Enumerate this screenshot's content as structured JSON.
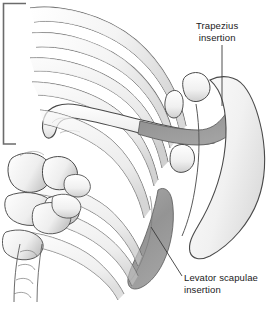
{
  "figure": {
    "kind": "anatomical-line-drawing",
    "background_color": "#ffffff",
    "line_color": "#4a4a4a",
    "shading_color": "#9a9a9a",
    "light_shading_color": "#d9d9d9"
  },
  "frame": {
    "name": "border-bracket",
    "color": "#6b6b6b"
  },
  "labels": {
    "trapezius": {
      "line1": "Trapezius",
      "line2": "insertion",
      "leader": "vertical"
    },
    "levator": {
      "line1": "Levator scapulae",
      "line2": "insertion",
      "leader": "diagonal"
    }
  }
}
